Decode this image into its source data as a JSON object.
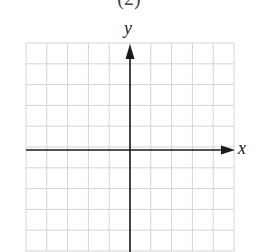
{
  "panel": {
    "label": "(2)"
  },
  "axes": {
    "x_label": "x",
    "y_label": "y"
  },
  "grid": {
    "columns": 10,
    "rows": 10,
    "left": 26,
    "top": 43,
    "cell": 20.8,
    "line_color": "#d4d4d4",
    "axis_color": "#1a1a1a"
  }
}
